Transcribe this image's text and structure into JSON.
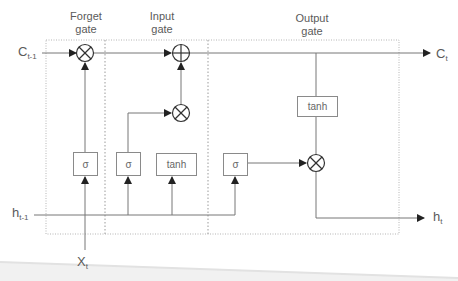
{
  "diagram": {
    "type": "LSTM cell",
    "gates": {
      "forget": {
        "label_line1": "Forget",
        "label_line2": "gate"
      },
      "input": {
        "label_line1": "Input",
        "label_line2": "gate"
      },
      "output": {
        "label_line1": "Output",
        "label_line2": "gate"
      }
    },
    "inputs": {
      "c_prev": {
        "base": "C",
        "sub": "t-1"
      },
      "h_prev": {
        "base": "h",
        "sub": "t-1"
      },
      "x": {
        "base": "X",
        "sub": "t"
      }
    },
    "outputs": {
      "c_t": {
        "base": "C",
        "sub": "t"
      },
      "h_t": {
        "base": "h",
        "sub": "t"
      }
    },
    "blocks": {
      "forget_sigma": "σ",
      "input_sigma": "σ",
      "input_tanh": "tanh",
      "output_sigma": "σ",
      "output_tanh": "tanh"
    },
    "operators": {
      "forget_multiply": "⊗",
      "input_add": "⊕",
      "input_multiply": "⊗",
      "output_multiply": "⊗"
    },
    "colors": {
      "line": "#777777",
      "dotted_border": "#aaaaaa",
      "text": "#5a5a5a"
    }
  }
}
